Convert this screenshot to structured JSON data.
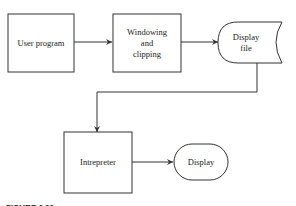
{
  "diagram": {
    "nodes": [
      {
        "id": "user_program",
        "type": "process",
        "lines": [
          "User program"
        ]
      },
      {
        "id": "windowing",
        "type": "process",
        "lines": [
          "Windowing",
          "and",
          "clipping"
        ]
      },
      {
        "id": "display_file",
        "type": "stored-data",
        "lines": [
          "Display",
          "file"
        ]
      },
      {
        "id": "interpreter",
        "type": "process",
        "lines": [
          "Intrepreter"
        ]
      },
      {
        "id": "display",
        "type": "terminal",
        "lines": [
          "Display"
        ]
      }
    ],
    "edges": [
      {
        "from": "user_program",
        "to": "windowing"
      },
      {
        "from": "windowing",
        "to": "display_file"
      },
      {
        "from": "display_file",
        "to": "interpreter"
      },
      {
        "from": "interpreter",
        "to": "display"
      }
    ],
    "caption": "FIGURE 6.20",
    "colors": {
      "stroke": "#333333",
      "text": "#222222",
      "background": "#ffffff"
    }
  }
}
